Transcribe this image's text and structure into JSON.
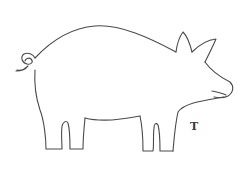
{
  "figure": {
    "label": "T",
    "stroke_color": "#4a4a4a",
    "background_color": "#ffffff"
  }
}
